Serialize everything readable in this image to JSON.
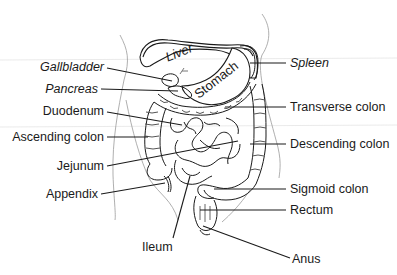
{
  "diagram": {
    "organ_labels": {
      "liver": "Liver",
      "stomach": "Stomach"
    },
    "left_labels": [
      {
        "id": "gallbladder",
        "text": "Gallbladder",
        "italic": true
      },
      {
        "id": "pancreas",
        "text": "Pancreas",
        "italic": true
      },
      {
        "id": "duodenum",
        "text": "Duodenum",
        "italic": false
      },
      {
        "id": "ascending-colon",
        "text": "Ascending colon",
        "italic": false
      },
      {
        "id": "jejunum",
        "text": "Jejunum",
        "italic": false
      },
      {
        "id": "appendix",
        "text": "Appendix",
        "italic": false
      }
    ],
    "right_labels": [
      {
        "id": "spleen",
        "text": "Spleen",
        "italic": true
      },
      {
        "id": "transverse-colon",
        "text": "Transverse colon",
        "italic": false
      },
      {
        "id": "descending-colon",
        "text": "Descending colon",
        "italic": false
      },
      {
        "id": "sigmoid-colon",
        "text": "Sigmoid colon",
        "italic": false
      },
      {
        "id": "rectum",
        "text": "Rectum",
        "italic": false
      },
      {
        "id": "anus",
        "text": "Anus",
        "italic": false
      }
    ],
    "bottom_labels": [
      {
        "id": "ileum",
        "text": "Ileum",
        "italic": false
      }
    ],
    "colors": {
      "line": "#1a1a1a",
      "faint": "#9a9a9a",
      "background": "#ffffff"
    }
  }
}
